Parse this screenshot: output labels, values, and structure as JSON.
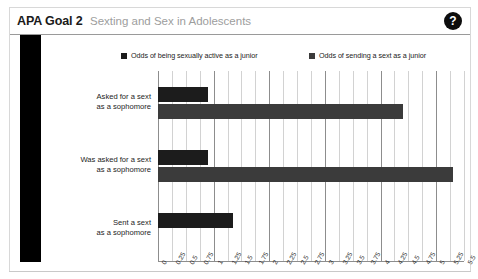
{
  "top_strip": {
    "ghost_text": ""
  },
  "header": {
    "title": "APA Goal 2",
    "subtitle": "Sexting and Sex in Adolescents",
    "help_label": "?"
  },
  "colors": {
    "series_1": "#1c1c1c",
    "series_2": "#3b3b3b",
    "gridline": "#d2d2d2",
    "gridline_major": "#8d8d8d",
    "subtitle": "#9d9d9d",
    "slab": "#000000",
    "help_bg": "#0d0d0d"
  },
  "chart_data": {
    "type": "bar",
    "orientation": "horizontal",
    "title": "Sexting and Sex in Adolescents",
    "xlabel": "",
    "ylabel": "",
    "xlim": [
      0,
      5.5
    ],
    "grid": true,
    "legend_position": "top",
    "categories": [
      "Asked for a sext as a sophomore",
      "Was asked for a sext as a sophomore",
      "Sent a sext as a sophomore"
    ],
    "category_lines": [
      [
        "Asked for a sext",
        "as a sophomore"
      ],
      [
        "Was asked for a sext",
        "as a sophomore"
      ],
      [
        "Sent a sext",
        "as a sophomore"
      ]
    ],
    "series": [
      {
        "name": "Odds of being sexually active as a junior",
        "color": "#1c1c1c",
        "values": [
          0.9,
          0.9,
          1.35
        ]
      },
      {
        "name": "Odds of sending a sext as a junior",
        "color": "#3b3b3b",
        "values": [
          4.4,
          5.3,
          null
        ]
      }
    ],
    "x_ticks": [
      "0",
      "0.25",
      "0.5",
      "0.75",
      "1",
      "1.25",
      "1.5",
      "1.75",
      "2",
      "2.25",
      "2.5",
      "2.75",
      "3",
      "3.25",
      "3.5",
      "3.75",
      "4",
      "4.25",
      "4.5",
      "4.75",
      "5",
      "5.25",
      "5.5"
    ],
    "x_tick_values": [
      0,
      0.25,
      0.5,
      0.75,
      1,
      1.25,
      1.5,
      1.75,
      2,
      2.25,
      2.5,
      2.75,
      3,
      3.25,
      3.5,
      3.75,
      4,
      4.25,
      4.5,
      4.75,
      5,
      5.25,
      5.5
    ],
    "major_ticks": [
      0,
      1,
      2,
      3,
      4,
      5
    ]
  }
}
